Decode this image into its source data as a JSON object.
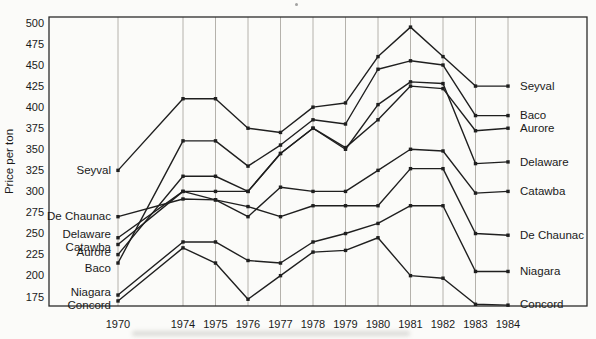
{
  "chart_data": {
    "type": "line",
    "title": "",
    "ylabel": "Price per ton",
    "xlabel": "",
    "x_categories": [
      1970,
      1974,
      1975,
      1976,
      1977,
      1978,
      1979,
      1980,
      1981,
      1982,
      1983,
      1984
    ],
    "y_ticks": [
      175,
      200,
      225,
      250,
      275,
      300,
      325,
      350,
      375,
      400,
      425,
      450,
      475,
      500
    ],
    "ylim": [
      164,
      507
    ],
    "grid": "vertical-only",
    "legend_position": "in-plot labels at both line ends",
    "marker": "small filled square",
    "series": [
      {
        "name": "Seyval",
        "values": [
          325,
          410,
          410,
          375,
          370,
          400,
          405,
          460,
          495,
          460,
          425,
          425
        ]
      },
      {
        "name": "Baco",
        "values": [
          215,
          360,
          360,
          330,
          355,
          385,
          380,
          445,
          455,
          450,
          390,
          390
        ]
      },
      {
        "name": "Aurore",
        "values": [
          225,
          318,
          318,
          300,
          345,
          375,
          352,
          385,
          425,
          422,
          372,
          375
        ]
      },
      {
        "name": "Delaware",
        "values": [
          245,
          300,
          300,
          300,
          345,
          375,
          350,
          403,
          430,
          428,
          333,
          335
        ]
      },
      {
        "name": "Catawba",
        "values": [
          237,
          300,
          290,
          270,
          305,
          300,
          300,
          325,
          350,
          348,
          298,
          300
        ]
      },
      {
        "name": "De Chaunac",
        "values": [
          270,
          291,
          290,
          282,
          270,
          283,
          283,
          283,
          327,
          327,
          250,
          248
        ]
      },
      {
        "name": "Niagara",
        "values": [
          177,
          240,
          240,
          218,
          215,
          240,
          250,
          262,
          283,
          283,
          205,
          205
        ]
      },
      {
        "name": "Concord",
        "values": [
          170,
          233,
          215,
          172,
          200,
          228,
          230,
          245,
          200,
          197,
          166,
          165
        ]
      }
    ],
    "left_label_order": [
      "Seyval",
      "De Chaunac",
      "Delaware",
      "Catawba",
      "Aurore",
      "Baco",
      "Niagara",
      "Concord"
    ],
    "right_label_order": [
      "Seyval",
      "Baco",
      "Aurore",
      "Delaware",
      "Catawba",
      "De Chaunac",
      "Niagara",
      "Concord"
    ]
  },
  "colors": {
    "line": "#1f1f1f",
    "grid": "#b5b2ac",
    "frame": "#2b2b2b",
    "text": "#1a1a1a",
    "paper": "#fbfbf9"
  }
}
